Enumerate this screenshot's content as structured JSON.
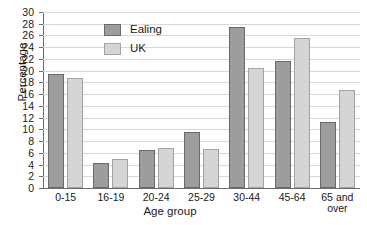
{
  "chart_data": {
    "type": "bar",
    "title": "",
    "xlabel": "Age group",
    "ylabel": "Percentage",
    "categories": [
      "0-15",
      "16-19",
      "20-24",
      "25-29",
      "30-44",
      "45-64",
      "65 and over"
    ],
    "category_lines": [
      [
        "0-15"
      ],
      [
        "16-19"
      ],
      [
        "20-24"
      ],
      [
        "25-29"
      ],
      [
        "30-44"
      ],
      [
        "45-64"
      ],
      [
        "65 and",
        "over"
      ]
    ],
    "series": [
      {
        "name": "Ealing",
        "color": "#9d9d9d",
        "border": "#6a6a6a",
        "values": [
          19.5,
          4.2,
          6.5,
          9.5,
          27.4,
          21.7,
          11.2
        ]
      },
      {
        "name": "UK",
        "color": "#d5d5d5",
        "border": "#a2a2a2",
        "values": [
          18.7,
          5.0,
          6.9,
          6.7,
          20.4,
          25.5,
          16.7
        ]
      }
    ],
    "ylim": [
      0,
      30
    ],
    "ytick_step": 2,
    "yticks": [
      "0",
      "2",
      "4",
      "6",
      "8",
      "10",
      "12",
      "14",
      "16",
      "18",
      "20",
      "22",
      "24",
      "26",
      "28",
      "30"
    ],
    "grid": true,
    "legend_position": "top-left-inside"
  },
  "legend": {
    "entries": [
      {
        "label": "Ealing"
      },
      {
        "label": "UK"
      }
    ]
  },
  "axes": {
    "y_title": "Percentage",
    "x_title": "Age group"
  }
}
